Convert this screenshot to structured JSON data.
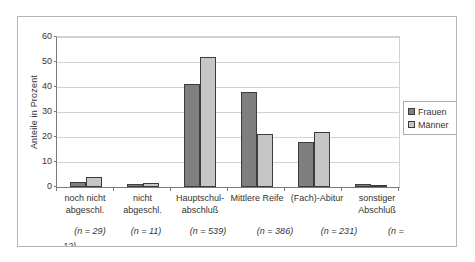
{
  "chart_data": {
    "type": "bar",
    "title": "",
    "xlabel": "",
    "ylabel": "Anteile in Prozent",
    "ylim": [
      0,
      60
    ],
    "ytick_step": 10,
    "grid": true,
    "legend_position": "right",
    "categories": [
      "noch nicht abgeschl.",
      "nicht abgeschl.",
      "Hauptschul-abschluß",
      "Mittlere Reife",
      "(Fach)-Abitur",
      "sonstiger Abschluß"
    ],
    "category_label_lines": [
      [
        "noch nicht",
        "abgeschl."
      ],
      [
        "nicht",
        "abgeschl."
      ],
      [
        "Hauptschul-",
        "abschluß"
      ],
      [
        "Mittlere Reife"
      ],
      [
        "(Fach)-Abitur"
      ],
      [
        "sonstiger",
        "Abschluß"
      ]
    ],
    "n_values": [
      29,
      11,
      539,
      386,
      231,
      12
    ],
    "n_labels": [
      "(n = 29)",
      "(n = 11)",
      "(n = 539)",
      "(n = 386)",
      "(n = 231)",
      "(n ="
    ],
    "n_label_wrapped": "12)",
    "series": [
      {
        "name": "Frauen",
        "color": "#7f7f7f",
        "values": [
          2,
          1,
          41,
          38,
          18,
          1.2
        ]
      },
      {
        "name": "Männer",
        "color": "#c6c6c6",
        "values": [
          4,
          1.5,
          52,
          21,
          22,
          0.8
        ]
      }
    ]
  }
}
